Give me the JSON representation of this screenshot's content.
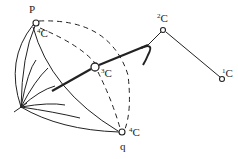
{
  "diagram": {
    "type": "stereochemical-projection",
    "points": {
      "P": {
        "label": "P",
        "atom_label": "C",
        "atom_sup": "4"
      },
      "q": {
        "label": "q",
        "atom_label": "C",
        "atom_sup": "4"
      },
      "c3": {
        "atom_label": "C",
        "atom_sup": "3"
      },
      "c2": {
        "atom_label": "C",
        "atom_sup": "2"
      },
      "c1": {
        "atom_label": "C",
        "atom_sup": "1"
      }
    },
    "colors": {
      "stroke": "#222222",
      "background": "#ffffff"
    }
  }
}
